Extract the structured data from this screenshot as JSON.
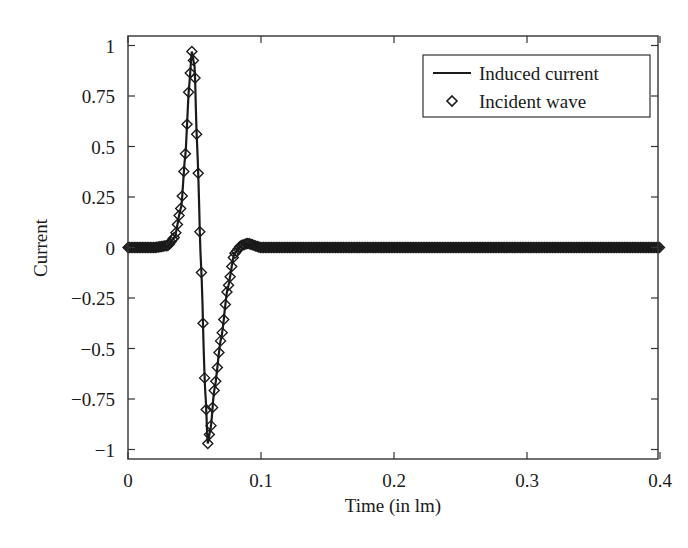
{
  "chart_data": {
    "type": "line",
    "title": "",
    "xlabel": "Time (in lm)",
    "ylabel": "Current",
    "xlim": [
      0,
      0.4
    ],
    "ylim": [
      -1,
      1
    ],
    "x_ticks": [
      "0",
      "0.1",
      "0.2",
      "0.3",
      "0.4"
    ],
    "y_ticks": [
      "1",
      "0.75",
      "0.5",
      "0.25",
      "0",
      "−0.25",
      "−0.5",
      "−0.75",
      "−1"
    ],
    "grid": false,
    "legend_position": "upper right",
    "legend": [
      {
        "label": "Induced current",
        "marker": "line"
      },
      {
        "label": "Incident wave",
        "marker": "diamond"
      }
    ],
    "series": [
      {
        "name": "Induced current",
        "style": "solid-line",
        "x": [
          0,
          0.02,
          0.03,
          0.035,
          0.04,
          0.043,
          0.046,
          0.048,
          0.05,
          0.052,
          0.055,
          0.058,
          0.06,
          0.062,
          0.065,
          0.07,
          0.075,
          0.08,
          0.085,
          0.09,
          0.1,
          0.2,
          0.3,
          0.4
        ],
        "y": [
          0,
          0,
          0.01,
          0.05,
          0.2,
          0.45,
          0.8,
          0.97,
          0.9,
          0.5,
          -0.1,
          -0.7,
          -0.97,
          -0.9,
          -0.7,
          -0.45,
          -0.2,
          -0.03,
          0.01,
          0.02,
          0,
          0,
          0,
          0
        ]
      },
      {
        "name": "Incident wave",
        "style": "diamond-markers",
        "x": [
          0,
          0.02,
          0.03,
          0.035,
          0.04,
          0.043,
          0.046,
          0.048,
          0.05,
          0.052,
          0.055,
          0.058,
          0.06,
          0.062,
          0.065,
          0.07,
          0.075,
          0.08,
          0.085,
          0.09,
          0.1,
          0.2,
          0.3,
          0.4
        ],
        "y": [
          0,
          0,
          0.01,
          0.05,
          0.2,
          0.45,
          0.8,
          0.97,
          0.9,
          0.5,
          -0.1,
          -0.7,
          -0.97,
          -0.9,
          -0.7,
          -0.45,
          -0.2,
          -0.03,
          0.01,
          0.02,
          0,
          0,
          0,
          0
        ]
      }
    ]
  },
  "colors": {
    "line": "#1a1a1a",
    "axis": "#333333",
    "background": "#ffffff"
  }
}
